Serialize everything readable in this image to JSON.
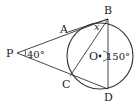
{
  "figure": {
    "type": "geometry",
    "colors": {
      "stroke": "#333333",
      "text": "#222222",
      "background": "#ffffff"
    },
    "circle": {
      "center_label": "O",
      "cx": 100,
      "cy": 56,
      "r": 33
    },
    "points": {
      "P": {
        "label": "P",
        "x": 17,
        "y": 53
      },
      "A": {
        "label": "A",
        "x": 68,
        "y": 31
      },
      "B": {
        "label": "B",
        "x": 108,
        "y": 19
      },
      "C": {
        "label": "C",
        "x": 70,
        "y": 76
      },
      "D": {
        "label": "D",
        "x": 108,
        "y": 89
      },
      "O": {
        "label": "O",
        "x": 100,
        "y": 56
      }
    },
    "segments": [
      [
        "P",
        "B"
      ],
      [
        "P",
        "D"
      ],
      [
        "A",
        "B"
      ],
      [
        "B",
        "C"
      ],
      [
        "B",
        "D"
      ]
    ],
    "angle_labels": {
      "P": "40°",
      "O": "150°",
      "B": "x"
    }
  }
}
